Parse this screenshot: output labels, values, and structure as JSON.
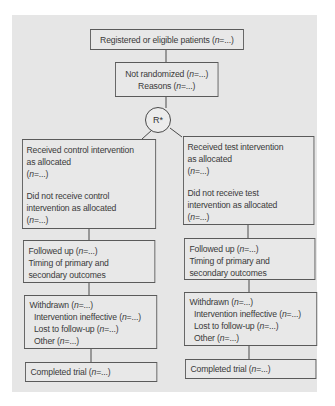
{
  "diagram": {
    "colors": {
      "panel_background": "#e6e6e6",
      "box_fill": "#e8e8e8",
      "box_border": "#5a5a5a",
      "text": "#3a3a3a"
    },
    "nodes": {
      "registered": {
        "text": "Registered or eligible patients (n=...)",
        "prefix": "Registered or eligible patients (",
        "n": "n",
        "suffix": "=...)"
      },
      "not_randomized": {
        "line1_prefix": "Not randomized (",
        "line1_suffix": "=...)",
        "line2_prefix": "Reasons (",
        "line2_suffix": "=...)",
        "n": "n"
      },
      "randomization": {
        "label": "R*"
      },
      "control_allocation": {
        "received_line1": "Received control intervention",
        "received_line2": "as allocated",
        "received_n_prefix": "(",
        "received_n_suffix": "=...)",
        "not_received_line1": "Did not receive control",
        "not_received_line2": "intervention as allocated",
        "not_received_n_prefix": "(",
        "not_received_n_suffix": "=...)",
        "n": "n"
      },
      "test_allocation": {
        "received_line1": "Received test intervention",
        "received_line2": "as allocated",
        "received_n_prefix": "(",
        "received_n_suffix": "=...)",
        "not_received_line1": "Did not receive test",
        "not_received_line2": "intervention as allocated",
        "not_received_n_prefix": "(",
        "not_received_n_suffix": "=...)",
        "n": "n"
      },
      "control_followup": {
        "line1_prefix": "Followed up (",
        "line1_suffix": "=...)",
        "line2": "Timing of primary and",
        "line3": "secondary outcomes",
        "n": "n"
      },
      "test_followup": {
        "line1_prefix": "Followed up (",
        "line1_suffix": "=...)",
        "line2": "Timing of primary and",
        "line3": "secondary outcomes",
        "n": "n"
      },
      "control_withdrawn": {
        "line1_prefix": "Withdrawn (",
        "line1_suffix": "=...)",
        "line2_prefix": "Intervention ineffective (",
        "line2_suffix": "=...)",
        "line3_prefix": "Lost to follow-up (",
        "line3_suffix": "=...)",
        "line4_prefix": "Other (",
        "line4_suffix": "=...)",
        "n": "n"
      },
      "test_withdrawn": {
        "line1_prefix": "Withdrawn (",
        "line1_suffix": "=...)",
        "line2_prefix": "Intervention ineffective (",
        "line2_suffix": "=...)",
        "line3_prefix": "Lost to follow-up (",
        "line3_suffix": "=...)",
        "line4_prefix": "Other (",
        "line4_suffix": "=...)",
        "n": "n"
      },
      "control_completed": {
        "prefix": "Completed trial (",
        "suffix": "=...)",
        "n": "n"
      },
      "test_completed": {
        "prefix": "Completed trial (",
        "suffix": "=...)",
        "n": "n"
      }
    }
  }
}
